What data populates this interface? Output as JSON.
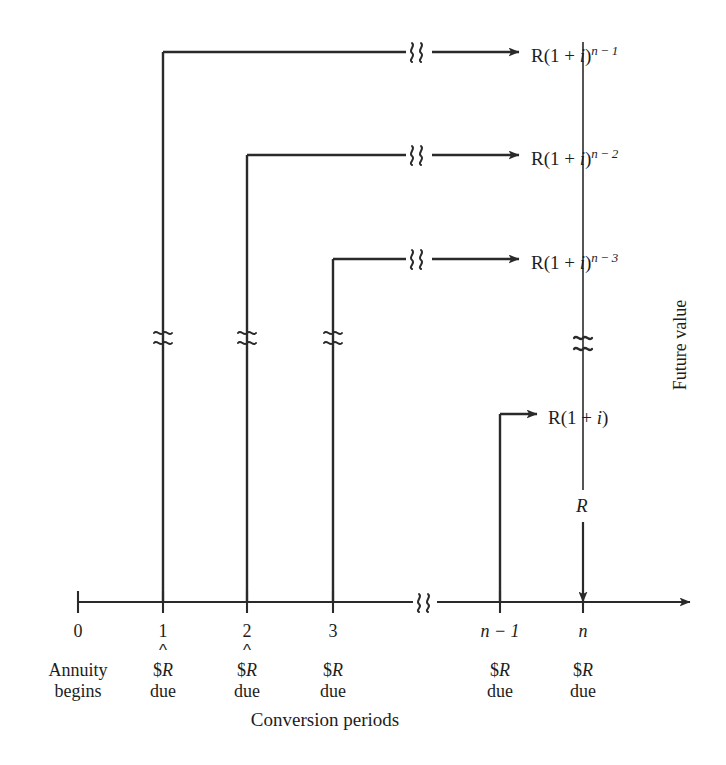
{
  "diagram": {
    "axis_caption": "Conversion periods",
    "side_caption": "Future value",
    "left_note_line1": "Annuity",
    "left_note_line2": "begins",
    "line_color": "#2a2a2a",
    "text_color": "#1d1d1d",
    "background": "#ffffff",
    "ticks": [
      {
        "label": "0",
        "x": 78,
        "italic": false,
        "has_caret": false,
        "payment_line1": "",
        "payment_line2": ""
      },
      {
        "label": "1",
        "x": 163,
        "italic": false,
        "has_caret": true,
        "payment_line1": "$R",
        "payment_line2": "due"
      },
      {
        "label": "2",
        "x": 247,
        "italic": false,
        "has_caret": true,
        "payment_line1": "$R",
        "payment_line2": "due"
      },
      {
        "label": "3",
        "x": 333,
        "italic": false,
        "has_caret": false,
        "payment_line1": "$R",
        "payment_line2": "due"
      },
      {
        "label": "n − 1",
        "x": 500,
        "italic": true,
        "has_caret": false,
        "payment_line1": "$R",
        "payment_line2": "due"
      },
      {
        "label": "n",
        "x": 583,
        "italic": true,
        "has_caret": false,
        "payment_line1": "$R",
        "payment_line2": "due"
      }
    ],
    "break_symbol_axis": "≈",
    "break_symbol_vertical": "≈",
    "flows": [
      {
        "name": "payment-1-flow",
        "from_tick": "1",
        "label_base": "R(1 + i)",
        "label_exponent": "n − 1",
        "label_text": "R(1 + i)^(n − 1)",
        "y": 52,
        "has_break": true
      },
      {
        "name": "payment-2-flow",
        "from_tick": "2",
        "label_base": "R(1 + i)",
        "label_exponent": "n − 2",
        "label_text": "R(1 + i)^(n − 2)",
        "y": 155,
        "has_break": true
      },
      {
        "name": "payment-3-flow",
        "from_tick": "3",
        "label_base": "R(1 + i)",
        "label_exponent": "n − 3",
        "label_text": "R(1 + i)^(n − 3)",
        "y": 259,
        "has_break": true
      },
      {
        "name": "payment-n-minus-1-flow",
        "from_tick": "n − 1",
        "label_base": "R(1 + i)",
        "label_exponent": "",
        "label_text": "R(1 + i)",
        "y": 414,
        "has_break": false
      },
      {
        "name": "payment-n-flow",
        "from_tick": "n",
        "label_base": "R",
        "label_exponent": "",
        "label_text": "R",
        "y": 505,
        "has_break": false
      }
    ]
  }
}
